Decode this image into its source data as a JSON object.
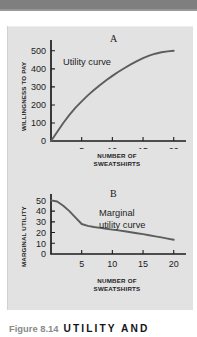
{
  "figure": {
    "caption_number": "Figure 8.14",
    "caption_title": "UTILITY AND"
  },
  "colors": {
    "panel_background": "#e2e2e2",
    "top_bar": "#7f7f7f",
    "axis": "#1c1c1c",
    "curve": "#5d5d5d",
    "caption_number": "#8a8a8a",
    "caption_title": "#141414"
  },
  "chart_data": [
    {
      "type": "line",
      "panel": "A",
      "title": "A",
      "annotation": "Utility curve",
      "xlabel": "NUMBER OF SWEATSHIRTS",
      "ylabel": "WILLINGNESS TO PAY",
      "xticks": [
        5,
        10,
        15,
        20
      ],
      "yticks": [
        0,
        100,
        200,
        300,
        400,
        500
      ],
      "xlim": [
        0,
        22
      ],
      "ylim": [
        0,
        560
      ],
      "grid": false,
      "legend": "none",
      "x": [
        0,
        1,
        2,
        3,
        4,
        5,
        6,
        7,
        8,
        9,
        10,
        11,
        12,
        13,
        14,
        15,
        16,
        17,
        18,
        19,
        20
      ],
      "y": [
        0,
        50,
        100,
        145,
        185,
        220,
        253,
        283,
        311,
        337,
        361,
        384,
        405,
        425,
        443,
        460,
        473,
        484,
        492,
        497,
        500
      ]
    },
    {
      "type": "line",
      "panel": "B",
      "title": "B",
      "annotation": "Marginal utility curve",
      "xlabel": "NUMBER OF SWEATSHIRTS",
      "ylabel": "MARGINAL UTILITY",
      "xticks": [
        5,
        10,
        15,
        20
      ],
      "yticks": [
        0,
        10,
        20,
        30,
        40,
        50
      ],
      "xlim": [
        0,
        22
      ],
      "ylim": [
        0,
        56
      ],
      "grid": false,
      "legend": "none",
      "x": [
        0,
        1,
        2,
        3,
        4,
        5,
        6,
        7,
        8,
        9,
        10,
        11,
        12,
        13,
        14,
        15,
        16,
        17,
        18,
        19,
        20
      ],
      "y": [
        50,
        49,
        45,
        40,
        34,
        28,
        26.2,
        25.2,
        24.4,
        23.6,
        22.8,
        22.0,
        21.2,
        20.3,
        19.4,
        18.5,
        17.5,
        16.5,
        15.5,
        14.4,
        13.3
      ]
    }
  ]
}
